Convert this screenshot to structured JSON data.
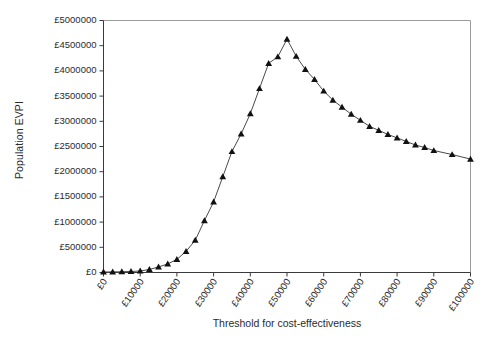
{
  "chart_data": {
    "type": "line",
    "title": "",
    "xlabel": "Threshold for cost-effectiveness",
    "ylabel": "Population EVPI",
    "xlim": [
      0,
      100000
    ],
    "ylim": [
      0,
      5000000
    ],
    "grid": false,
    "legend": "none",
    "marker": "triangle",
    "line_color": "#4a4a4a",
    "marker_color": "#111111",
    "x_tick_labels": [
      "£0",
      "£10000",
      "£20000",
      "£30000",
      "£40000",
      "£50000",
      "£60000",
      "£70000",
      "£80000",
      "£90000",
      "£100000"
    ],
    "x_tick_values": [
      0,
      10000,
      20000,
      30000,
      40000,
      50000,
      60000,
      70000,
      80000,
      90000,
      100000
    ],
    "y_tick_labels": [
      "£0",
      "£500000",
      "£1000000",
      "£1500000",
      "£2000000",
      "£2500000",
      "£3000000",
      "£3500000",
      "£4000000",
      "£4500000",
      "£5000000"
    ],
    "y_tick_values": [
      0,
      500000,
      1000000,
      1500000,
      2000000,
      2500000,
      3000000,
      3500000,
      4000000,
      4500000,
      5000000
    ],
    "series": [
      {
        "name": "Population EVPI",
        "x": [
          0,
          2500,
          5000,
          7500,
          10000,
          12500,
          15000,
          17500,
          20000,
          22500,
          25000,
          27500,
          30000,
          32500,
          35000,
          37500,
          40000,
          42500,
          45000,
          47500,
          50000,
          52500,
          55000,
          57500,
          60000,
          62500,
          65000,
          67500,
          70000,
          72500,
          75000,
          77500,
          80000,
          82500,
          85000,
          87500,
          90000,
          95000,
          100000
        ],
        "values": [
          10000,
          12000,
          15000,
          20000,
          30000,
          60000,
          110000,
          170000,
          260000,
          420000,
          640000,
          1030000,
          1400000,
          1900000,
          2400000,
          2750000,
          3150000,
          3650000,
          4150000,
          4280000,
          4630000,
          4290000,
          4030000,
          3830000,
          3600000,
          3420000,
          3280000,
          3140000,
          3020000,
          2900000,
          2820000,
          2740000,
          2670000,
          2600000,
          2530000,
          2480000,
          2420000,
          2340000,
          2250000
        ]
      }
    ]
  },
  "axis_titles": {
    "y": "Population EVPI",
    "x": "Threshold for cost-effectiveness"
  }
}
